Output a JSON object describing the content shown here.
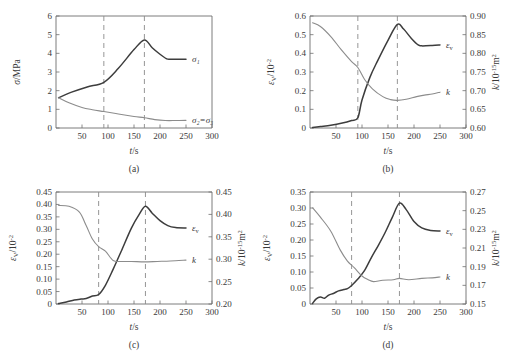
{
  "figure": {
    "background": "#ffffff",
    "curve_dark_color": "#3d3d3d",
    "curve_light_color": "#8c8c8c",
    "axis_color": "#6e6e6e",
    "dashed_color": "#8a8a8a"
  },
  "panels": [
    {
      "tag": "(a)",
      "xlabel": "t/s",
      "xticks": [
        "50",
        "100",
        "150",
        "200",
        "250",
        "300"
      ],
      "xlim": [
        0,
        300
      ],
      "left_axis": {
        "label_main": "σ",
        "label_unit": "/MPa",
        "ticks": [
          "0",
          "1",
          "2",
          "3",
          "4",
          "5",
          "6"
        ],
        "lim": [
          0,
          6
        ]
      },
      "right_axis": null,
      "markers": [
        92,
        170
      ],
      "series_labels": [
        "σ₁",
        "σ₂=σ₃"
      ]
    },
    {
      "tag": "(b)",
      "xlabel": "t/s",
      "xticks": [
        "50",
        "100",
        "150",
        "200",
        "250",
        "300"
      ],
      "xlim": [
        0,
        300
      ],
      "left_axis": {
        "label_main": "ε",
        "label_sub": "V",
        "label_unit": "/10",
        "label_exp": "-2",
        "ticks": [
          "0",
          "0.1",
          "0.2",
          "0.3",
          "0.4",
          "0.5",
          "0.6"
        ],
        "lim": [
          0,
          0.6
        ]
      },
      "right_axis": {
        "label_main": "k",
        "label_unit": "/10",
        "label_exp": "-15",
        "label_tail": "m",
        "label_tail_exp": "2",
        "ticks": [
          "0.60",
          "0.65",
          "0.70",
          "0.75",
          "0.80",
          "0.85",
          "0.90"
        ],
        "lim": [
          0.6,
          0.9
        ]
      },
      "markers": [
        92,
        168
      ],
      "series_labels": [
        "ε",
        "k"
      ]
    },
    {
      "tag": "(c)",
      "xlabel": "t/s",
      "xticks": [
        "50",
        "100",
        "150",
        "200",
        "250",
        "300"
      ],
      "xlim": [
        0,
        300
      ],
      "left_axis": {
        "label_main": "ε",
        "label_sub": "V",
        "label_unit": "/10",
        "label_exp": "-2",
        "ticks": [
          "0",
          "0.05",
          "0.10",
          "0.15",
          "0.20",
          "0.25",
          "0.30",
          "0.35",
          "0.40",
          "0.45"
        ],
        "lim": [
          0,
          0.45
        ]
      },
      "right_axis": {
        "label_main": "k",
        "label_unit": "/10",
        "label_exp": "-15",
        "label_tail": "m",
        "label_tail_exp": "2",
        "ticks": [
          "0.20",
          "0.25",
          "0.30",
          "0.35",
          "0.40",
          "0.45"
        ],
        "lim": [
          0.2,
          0.45
        ]
      },
      "markers": [
        82,
        172
      ],
      "series_labels": [
        "ε",
        "k"
      ]
    },
    {
      "tag": "(d)",
      "xlabel": "t/s",
      "xticks": [
        "50",
        "100",
        "150",
        "200",
        "250",
        "300"
      ],
      "xlim": [
        0,
        300
      ],
      "left_axis": {
        "label_main": "ε",
        "label_sub": "V",
        "label_unit": "/10",
        "label_exp": "-2",
        "ticks": [
          "0",
          "0.05",
          "0.10",
          "0.15",
          "0.20",
          "0.25",
          "0.30",
          "0.35"
        ],
        "lim": [
          0,
          0.35
        ]
      },
      "right_axis": {
        "label_main": "k",
        "label_unit": "/10",
        "label_exp": "-15",
        "label_tail": "m",
        "label_tail_exp": "2",
        "ticks": [
          "0.15",
          "0.17",
          "0.19",
          "0.21",
          "0.23",
          "0.25",
          "0.27"
        ],
        "lim": [
          0.15,
          0.27
        ]
      },
      "markers": [
        80,
        172
      ],
      "series_labels": [
        "ε",
        "k"
      ]
    }
  ],
  "chart_data": [
    {
      "type": "line",
      "panel": "(a)",
      "title": "",
      "xlabel": "t/s",
      "ylabel": "σ/MPa",
      "xlim": [
        0,
        300
      ],
      "ylim": [
        0,
        6
      ],
      "grid": false,
      "legend_position": "inline-right",
      "annotations": [
        {
          "type": "vline",
          "x": 92,
          "style": "dashed"
        },
        {
          "type": "vline",
          "x": 170,
          "style": "dashed"
        }
      ],
      "series": [
        {
          "name": "σ₁",
          "x": [
            5,
            30,
            60,
            92,
            120,
            150,
            170,
            185,
            200,
            212,
            220,
            250
          ],
          "values": [
            1.62,
            1.92,
            2.2,
            2.45,
            3.2,
            4.2,
            4.72,
            4.3,
            3.95,
            3.72,
            3.68,
            3.68
          ]
        },
        {
          "name": "σ₂=σ₃",
          "x": [
            5,
            25,
            50,
            70,
            92,
            120,
            150,
            170,
            190,
            210,
            230,
            250
          ],
          "values": [
            1.62,
            1.35,
            1.1,
            0.98,
            0.88,
            0.75,
            0.62,
            0.55,
            0.45,
            0.4,
            0.4,
            0.41
          ]
        }
      ]
    },
    {
      "type": "line",
      "panel": "(b)",
      "title": "",
      "xlabel": "t/s",
      "ylabel_left": "εV/10^-2",
      "ylabel_right": "k/10^-15 m^2",
      "xlim": [
        0,
        300
      ],
      "ylim_left": [
        0,
        0.6
      ],
      "ylim_right": [
        0.6,
        0.9
      ],
      "grid": false,
      "annotations": [
        {
          "type": "vline",
          "x": 92,
          "style": "dashed"
        },
        {
          "type": "vline",
          "x": 168,
          "style": "dashed"
        }
      ],
      "series": [
        {
          "name": "εV",
          "axis": "left",
          "x": [
            5,
            20,
            40,
            60,
            80,
            92,
            100,
            115,
            130,
            150,
            168,
            180,
            195,
            208,
            215,
            235,
            250
          ],
          "values": [
            0.003,
            0.008,
            0.015,
            0.025,
            0.04,
            0.055,
            0.15,
            0.27,
            0.36,
            0.47,
            0.555,
            0.53,
            0.48,
            0.445,
            0.44,
            0.442,
            0.445
          ]
        },
        {
          "name": "k",
          "axis": "right",
          "x": [
            5,
            20,
            40,
            60,
            80,
            92,
            105,
            120,
            140,
            155,
            168,
            185,
            205,
            220,
            235,
            250
          ],
          "values": [
            0.882,
            0.872,
            0.845,
            0.81,
            0.778,
            0.762,
            0.73,
            0.705,
            0.684,
            0.676,
            0.674,
            0.677,
            0.684,
            0.688,
            0.691,
            0.696
          ]
        }
      ]
    },
    {
      "type": "line",
      "panel": "(c)",
      "title": "",
      "xlabel": "t/s",
      "ylabel_left": "εV/10^-2",
      "ylabel_right": "k/10^-15 m^2",
      "xlim": [
        0,
        300
      ],
      "ylim_left": [
        0,
        0.45
      ],
      "ylim_right": [
        0.2,
        0.45
      ],
      "grid": false,
      "annotations": [
        {
          "type": "vline",
          "x": 82,
          "style": "dashed"
        },
        {
          "type": "vline",
          "x": 172,
          "style": "dashed"
        }
      ],
      "series": [
        {
          "name": "εV",
          "axis": "left",
          "x": [
            5,
            20,
            35,
            48,
            58,
            70,
            82,
            95,
            110,
            125,
            145,
            160,
            172,
            185,
            200,
            215,
            230,
            250
          ],
          "values": [
            0.002,
            0.008,
            0.016,
            0.02,
            0.022,
            0.032,
            0.038,
            0.075,
            0.14,
            0.21,
            0.305,
            0.36,
            0.393,
            0.365,
            0.335,
            0.315,
            0.307,
            0.305
          ]
        },
        {
          "name": "k",
          "axis": "right",
          "x": [
            5,
            25,
            45,
            58,
            70,
            82,
            95,
            110,
            125,
            145,
            170,
            195,
            220,
            250
          ],
          "values": [
            0.42,
            0.418,
            0.405,
            0.375,
            0.345,
            0.328,
            0.318,
            0.297,
            0.295,
            0.295,
            0.294,
            0.295,
            0.296,
            0.298
          ]
        }
      ]
    },
    {
      "type": "line",
      "panel": "(d)",
      "title": "",
      "xlabel": "t/s",
      "ylabel_left": "εV/10^-2",
      "ylabel_right": "k/10^-15 m^2",
      "xlim": [
        0,
        300
      ],
      "ylim_left": [
        0,
        0.35
      ],
      "ylim_right": [
        0.15,
        0.27
      ],
      "grid": false,
      "annotations": [
        {
          "type": "vline",
          "x": 80,
          "style": "dashed"
        },
        {
          "type": "vline",
          "x": 172,
          "style": "dashed"
        }
      ],
      "series": [
        {
          "name": "εV",
          "axis": "left",
          "x": [
            5,
            12,
            20,
            28,
            36,
            45,
            55,
            65,
            72,
            80,
            92,
            105,
            118,
            132,
            145,
            158,
            172,
            185,
            200,
            215,
            232,
            250
          ],
          "values": [
            0.002,
            0.016,
            0.022,
            0.018,
            0.028,
            0.033,
            0.041,
            0.045,
            0.048,
            0.058,
            0.078,
            0.105,
            0.145,
            0.185,
            0.225,
            0.27,
            0.315,
            0.295,
            0.258,
            0.238,
            0.23,
            0.228
          ]
        },
        {
          "name": "k",
          "axis": "right",
          "x": [
            5,
            20,
            40,
            58,
            72,
            85,
            100,
            112,
            122,
            140,
            160,
            172,
            190,
            215,
            235,
            250
          ],
          "values": [
            0.253,
            0.243,
            0.228,
            0.208,
            0.196,
            0.189,
            0.18,
            0.176,
            0.174,
            0.1755,
            0.176,
            0.1775,
            0.176,
            0.1775,
            0.178,
            0.179
          ]
        }
      ]
    }
  ]
}
